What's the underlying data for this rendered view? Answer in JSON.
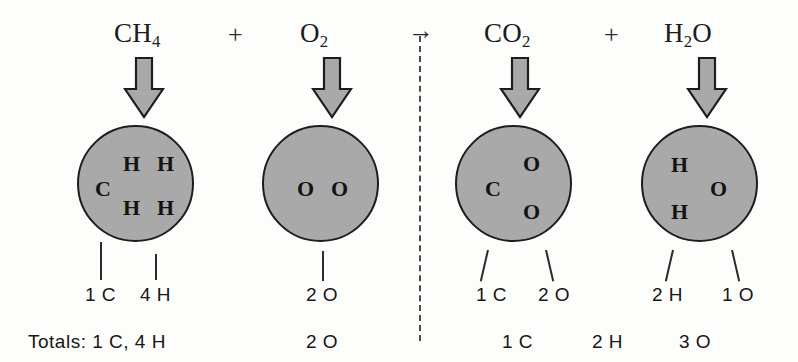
{
  "diagram": {
    "equation_plain": "CH4 + O2 -> CO2 + H2O",
    "colors": {
      "molecule_fill": "#a9a9a9",
      "molecule_stroke": "#1d1d1d",
      "arrow_fill": "#a9a9a9",
      "arrow_stroke": "#1d1d1d",
      "text": "#161616",
      "divider": "#4a4a4a",
      "background": "#fdfdfc"
    },
    "operators": {
      "plus_left": "+",
      "plus_right": "+",
      "reaction_arrow": "→"
    },
    "totals_label": "Totals:",
    "species": [
      {
        "id": "methane",
        "side": "reactant",
        "formula_head": "CH",
        "formula_sub": "4",
        "atoms": [
          {
            "symbol": "C"
          },
          {
            "symbol": "H"
          },
          {
            "symbol": "H"
          },
          {
            "symbol": "H"
          },
          {
            "symbol": "H"
          }
        ],
        "counts": [
          {
            "label": "1 C",
            "number": 1,
            "element": "C"
          },
          {
            "label": "4 H",
            "number": 4,
            "element": "H"
          }
        ]
      },
      {
        "id": "oxygen",
        "side": "reactant",
        "formula_head": "O",
        "formula_sub": "2",
        "atoms": [
          {
            "symbol": "O"
          },
          {
            "symbol": "O"
          }
        ],
        "counts": [
          {
            "label": "2 O",
            "number": 2,
            "element": "O"
          }
        ]
      },
      {
        "id": "carbon-dioxide",
        "side": "product",
        "formula_head": "CO",
        "formula_sub": "2",
        "atoms": [
          {
            "symbol": "C"
          },
          {
            "symbol": "O"
          },
          {
            "symbol": "O"
          }
        ],
        "counts": [
          {
            "label": "1 C",
            "number": 1,
            "element": "C"
          },
          {
            "label": "2 O",
            "number": 2,
            "element": "O"
          }
        ]
      },
      {
        "id": "water",
        "side": "product",
        "formula_head": "H",
        "formula_sub": "2",
        "formula_tail": "O",
        "atoms": [
          {
            "symbol": "H"
          },
          {
            "symbol": "H"
          },
          {
            "symbol": "O"
          }
        ],
        "counts": [
          {
            "label": "2 H",
            "number": 2,
            "element": "H"
          },
          {
            "label": "1 O",
            "number": 1,
            "element": "O"
          }
        ]
      }
    ],
    "totals": {
      "reactants": [
        {
          "label": "1 C, 4 H",
          "with_prefix": "Totals: 1 C, 4 H"
        },
        {
          "label": "2 O"
        }
      ],
      "products": [
        {
          "label": "1 C"
        },
        {
          "label": "2 H"
        },
        {
          "label": "3 O"
        }
      ]
    }
  }
}
